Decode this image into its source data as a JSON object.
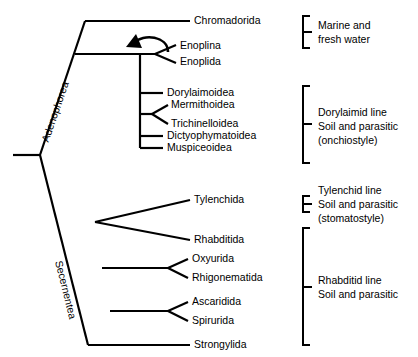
{
  "figure": {
    "background_color": "#ffffff",
    "line_color": "#000000"
  },
  "clades": [
    {
      "id": "adenophorea",
      "label": "Adenophorea"
    },
    {
      "id": "secernentea",
      "label": "Secernentea"
    }
  ],
  "taxa": [
    {
      "id": "chromadorida",
      "label": "Chromadorida"
    },
    {
      "id": "enoplina",
      "label": "Enoplina"
    },
    {
      "id": "enoplida",
      "label": "Enoplida"
    },
    {
      "id": "dorylaimoidea",
      "label": "Dorylaimoidea"
    },
    {
      "id": "mermithoidea",
      "label": "Mermithoidea"
    },
    {
      "id": "trichinelloidea",
      "label": "Trichinelloidea"
    },
    {
      "id": "dictyophymatoidea",
      "label": "Dictyophymatoidea"
    },
    {
      "id": "muspiceoidea",
      "label": "Muspiceoidea"
    },
    {
      "id": "tylenchida",
      "label": "Tylenchida"
    },
    {
      "id": "rhabditida",
      "label": "Rhabditida"
    },
    {
      "id": "oxyurida",
      "label": "Oxyurida"
    },
    {
      "id": "rhigonematida",
      "label": "Rhigonematida"
    },
    {
      "id": "ascaridida",
      "label": "Ascaridida"
    },
    {
      "id": "spirurida",
      "label": "Spirurida"
    },
    {
      "id": "strongylida",
      "label": "Strongylida"
    }
  ],
  "annotations": [
    {
      "id": "marine",
      "lines": [
        "Marine and",
        "fresh water"
      ],
      "line1": "Marine and",
      "line2": "fresh water",
      "line3": ""
    },
    {
      "id": "dorylaimid",
      "lines": [
        "Dorylaimid line",
        "Soil and parasitic",
        "(onchiostyle)"
      ],
      "line1": "Dorylaimid line",
      "line2": "Soil and parasitic",
      "line3": "(onchiostyle)"
    },
    {
      "id": "tylenchid",
      "lines": [
        "Tylenchid line",
        "Soil and parasitic",
        "(stomatostyle)"
      ],
      "line1": "Tylenchid line",
      "line2": "Soil and parasitic",
      "line3": "(stomatostyle)"
    },
    {
      "id": "rhabditid",
      "lines": [
        "Rhabditid line",
        "Soil and parasitic"
      ],
      "line1": "Rhabditid line",
      "line2": "Soil and parasitic",
      "line3": ""
    }
  ],
  "markers": [
    {
      "id": "enoplid-arrow",
      "name": "curved-arrow-icon"
    }
  ]
}
